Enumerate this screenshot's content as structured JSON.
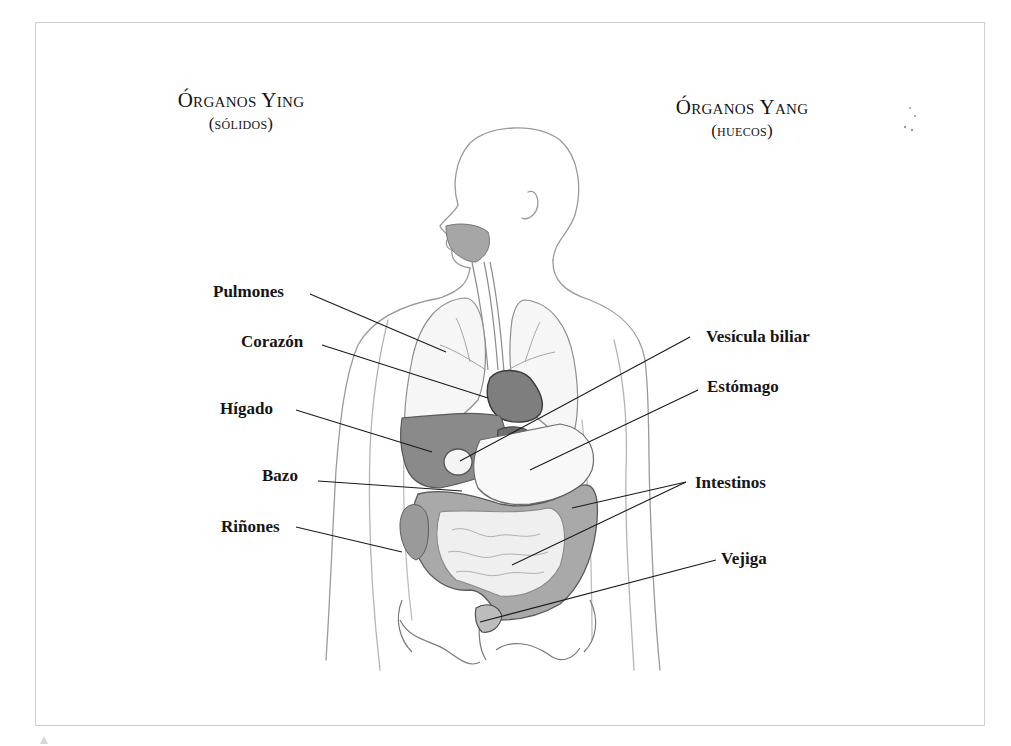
{
  "headings": {
    "ying": {
      "title": "Órganos Ying",
      "subtitle": "(sólidos)"
    },
    "yang": {
      "title": "Órganos Yang",
      "subtitle": "(huecos)"
    }
  },
  "labels": {
    "left": [
      {
        "id": "pulmones",
        "text": "Pulmones"
      },
      {
        "id": "corazon",
        "text": "Corazón"
      },
      {
        "id": "higado",
        "text": "Hígado"
      },
      {
        "id": "bazo",
        "text": "Bazo"
      },
      {
        "id": "rinones",
        "text": "Riñones"
      }
    ],
    "right": [
      {
        "id": "vesicula",
        "text": "Vesícula biliar"
      },
      {
        "id": "estomago",
        "text": "Estómago"
      },
      {
        "id": "intestinos",
        "text": "Intestinos"
      },
      {
        "id": "vejiga",
        "text": "Vejiga"
      }
    ]
  },
  "colors": {
    "organ_shade": "#8a8a8a",
    "organ_light": "#b5b5b5",
    "sketch_line": "#9a9a9a",
    "leader_line": "#1a1a1a",
    "frame": "#cfcfcf"
  }
}
